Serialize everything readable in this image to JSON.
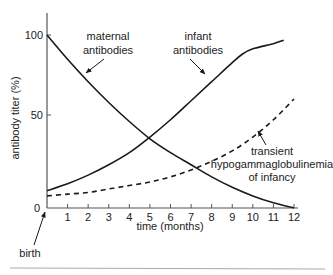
{
  "chart_data": {
    "type": "line",
    "title": "",
    "xlabel": "time (months)",
    "ylabel": "antibody titer (%)",
    "xlim": [
      0,
      12
    ],
    "ylim": [
      0,
      100
    ],
    "x_ticks": [
      0,
      1,
      2,
      3,
      4,
      5,
      6,
      7,
      8,
      9,
      10,
      11,
      12
    ],
    "x_tick_labels": [
      "1",
      "2",
      "3",
      "4",
      "5",
      "6",
      "7",
      "8",
      "9",
      "10",
      "11",
      "12"
    ],
    "y_ticks": [
      0,
      50,
      100
    ],
    "y_tick_labels": [
      "0",
      "50",
      "100"
    ],
    "grid": false,
    "legend": null,
    "series": [
      {
        "name": "maternal antibodies",
        "style": "solid",
        "x": [
          0,
          1,
          2,
          3,
          4,
          5,
          6,
          7,
          8,
          9,
          10,
          11,
          12
        ],
        "y": [
          100,
          86,
          73,
          61,
          50,
          40,
          32,
          25,
          18,
          12,
          7,
          3,
          0
        ]
      },
      {
        "name": "infant antibodies",
        "style": "solid",
        "x": [
          0,
          1,
          2,
          3,
          4,
          5,
          6,
          7,
          8,
          9,
          9.5,
          10,
          11,
          11.5
        ],
        "y": [
          10,
          14,
          19,
          25,
          32,
          41,
          51,
          62,
          73,
          84,
          89,
          92,
          95,
          97
        ]
      },
      {
        "name": "transient hypogammaglobulinemia of infancy",
        "style": "dashed",
        "x": [
          0,
          1,
          2,
          3,
          4,
          5,
          6,
          7,
          8,
          9,
          10,
          11,
          12
        ],
        "y": [
          7,
          8,
          9,
          11,
          13,
          15,
          18,
          22,
          27,
          33,
          41,
          51,
          63
        ]
      }
    ],
    "annotations": [
      {
        "text": "maternal antibodies",
        "target_series": "maternal antibodies"
      },
      {
        "text": "infant antibodies",
        "target_series": "infant antibodies"
      },
      {
        "text": "transient hypogammaglobulinemia of infancy",
        "target_series": "transient hypogammaglobulinemia of infancy"
      },
      {
        "text": "birth",
        "target": "x=0"
      }
    ]
  },
  "labels": {
    "maternal_line1": "maternal",
    "maternal_line2": "antibodies",
    "infant_line1": "infant",
    "infant_line2": "antibodies",
    "transient_line1": "transient",
    "transient_line2": "hypogammaglobulinemia",
    "transient_line3": "of infancy",
    "birth": "birth",
    "xlabel": "time (months)",
    "ylabel": "antibody titer (%)",
    "y0": "0",
    "y50": "50",
    "y100": "100"
  },
  "colors": {
    "line": "#1a1a1a",
    "axis": "#555555",
    "rule": "#999999"
  }
}
